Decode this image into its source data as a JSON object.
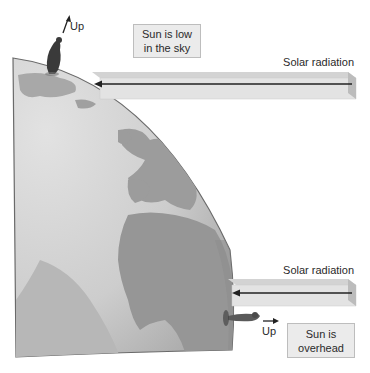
{
  "diagram": {
    "colors": {
      "background": "#ffffff",
      "ocean": "#c9c9c9",
      "land": "#9c9c9c",
      "globe_edge": "#6a6a6a",
      "beam_top": "#d8d8d8",
      "beam_front": "#e4e4e4",
      "beam_side": "#bdbdbd",
      "arrow": "#222222",
      "box_fill": "#ebebeb"
    },
    "top": {
      "up_label": "Up",
      "caption_line1": "Sun is low",
      "caption_line2": "in the sky",
      "radiation_label": "Solar radiation"
    },
    "bottom": {
      "up_label": "Up",
      "caption_line1": "Sun is",
      "caption_line2": "overhead",
      "radiation_label": "Solar radiation"
    }
  }
}
